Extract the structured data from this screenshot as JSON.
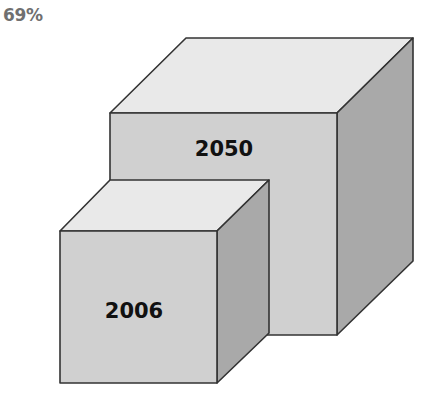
{
  "header": {
    "percentage": "69%"
  },
  "cubes": [
    {
      "label": "2050",
      "size": "large"
    },
    {
      "label": "2006",
      "size": "small"
    }
  ],
  "colors": {
    "top_face": "#e9e9e9",
    "front_face": "#d0d0d0",
    "side_face": "#a9a9a9",
    "edge": "#333333"
  }
}
